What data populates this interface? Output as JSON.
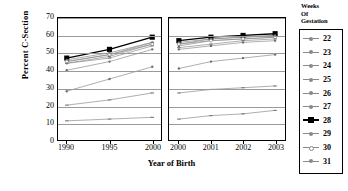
{
  "chart_data": {
    "type": "line",
    "title": "",
    "xlabel": "Year of Birth",
    "ylabel": "Percent C-Section",
    "ylim": [
      0,
      70
    ],
    "yticks": [
      0,
      10,
      20,
      30,
      40,
      50,
      60,
      70
    ],
    "grid": true,
    "legend_position": "right",
    "legend_title": "Weeks Of Gestation",
    "legend_title_lines": [
      "Weeks",
      "Of",
      "Gestation"
    ],
    "panels": [
      {
        "name": "panel-a",
        "x": [
          "1990",
          "1995",
          "2000"
        ]
      },
      {
        "name": "panel-b",
        "x": [
          "2000",
          "2001",
          "2002",
          "2003"
        ]
      }
    ],
    "categories": [
      "1990",
      "1995",
      "2000",
      "2000",
      "2001",
      "2002",
      "2003"
    ],
    "series": [
      {
        "name": "22",
        "marker": "dash",
        "emphasis": false,
        "panel_a": [
          11,
          12,
          13
        ],
        "panel_b": [
          12,
          14,
          15,
          17
        ]
      },
      {
        "name": "23",
        "marker": "dash",
        "emphasis": false,
        "panel_a": [
          20,
          23,
          27
        ],
        "panel_b": [
          27,
          29,
          30,
          31
        ]
      },
      {
        "name": "24",
        "marker": "dot",
        "emphasis": false,
        "panel_a": [
          28,
          35,
          42
        ],
        "panel_b": [
          41,
          45,
          47,
          49
        ]
      },
      {
        "name": "25",
        "marker": "dot",
        "emphasis": false,
        "panel_a": [
          40,
          45,
          52
        ],
        "panel_b": [
          52,
          54,
          56,
          57
        ]
      },
      {
        "name": "26",
        "marker": "dot",
        "emphasis": false,
        "panel_a": [
          44,
          48,
          55
        ],
        "panel_b": [
          54,
          57,
          58,
          59
        ]
      },
      {
        "name": "27",
        "marker": "dash",
        "emphasis": false,
        "panel_a": [
          45,
          49,
          56
        ],
        "panel_b": [
          55,
          58,
          59,
          60
        ]
      },
      {
        "name": "28",
        "marker": "square",
        "emphasis": true,
        "panel_a": [
          47,
          52,
          59
        ],
        "panel_b": [
          57,
          59,
          60,
          61
        ]
      },
      {
        "name": "29",
        "marker": "dot",
        "emphasis": false,
        "panel_a": [
          46,
          50,
          56
        ],
        "panel_b": [
          56,
          58,
          59,
          60
        ]
      },
      {
        "name": "30",
        "marker": "circle",
        "emphasis": false,
        "panel_a": [
          45,
          49,
          55
        ],
        "panel_b": [
          55,
          57,
          58,
          59
        ]
      },
      {
        "name": "31",
        "marker": "dash",
        "emphasis": false,
        "panel_a": [
          44,
          47,
          54
        ],
        "panel_b": [
          53,
          55,
          57,
          58
        ]
      }
    ]
  },
  "axis": {
    "y_title": "Percent C-Section",
    "x_title": "Year of Birth"
  }
}
